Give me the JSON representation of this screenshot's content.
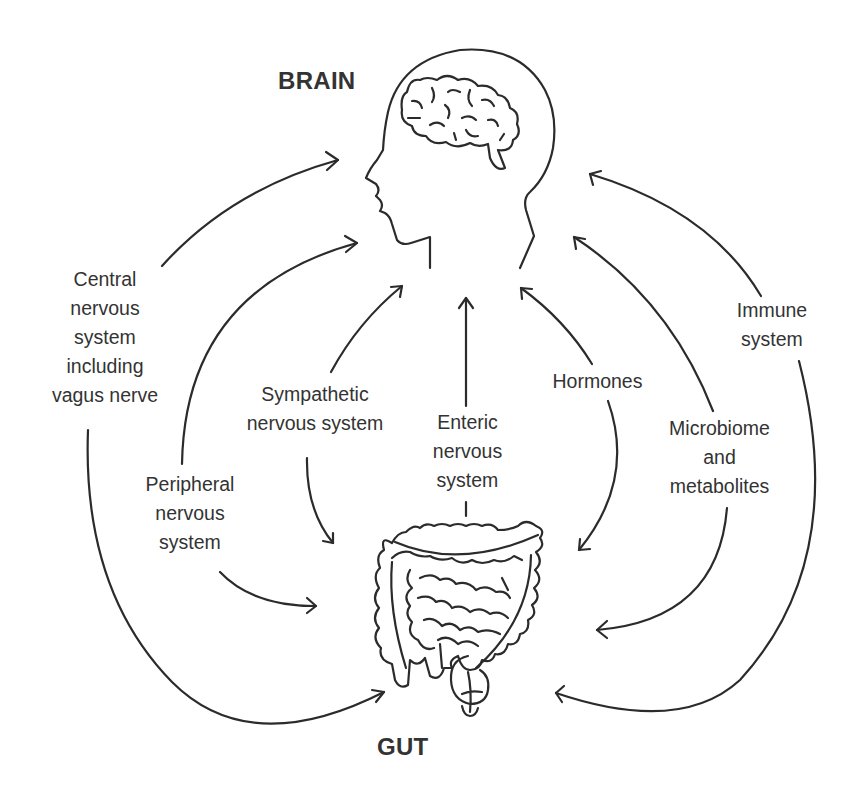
{
  "titles": {
    "brain": "BRAIN",
    "gut": "GUT"
  },
  "pathways": [
    {
      "id": "cns",
      "label": "Central\nnervous\nsystem\nincluding\nvagus nerve",
      "direction": "bidirectional"
    },
    {
      "id": "pns",
      "label": "Peripheral\nnervous\nsystem",
      "direction": "bidirectional"
    },
    {
      "id": "sns",
      "label": "Sympathetic\nnervous system",
      "direction": "bidirectional"
    },
    {
      "id": "ens",
      "label": "Enteric\nnervous\nsystem",
      "direction": "gut-to-brain"
    },
    {
      "id": "hormones",
      "label": "Hormones",
      "direction": "bidirectional"
    },
    {
      "id": "microbiome",
      "label": "Microbiome\nand\nmetabolites",
      "direction": "bidirectional"
    },
    {
      "id": "immune",
      "label": "Immune\nsystem",
      "direction": "bidirectional"
    }
  ],
  "icons": {
    "head": "head-with-brain",
    "intestine": "intestines"
  },
  "colors": {
    "line": "#2b2b2b",
    "text": "#333333",
    "background": "#ffffff"
  }
}
